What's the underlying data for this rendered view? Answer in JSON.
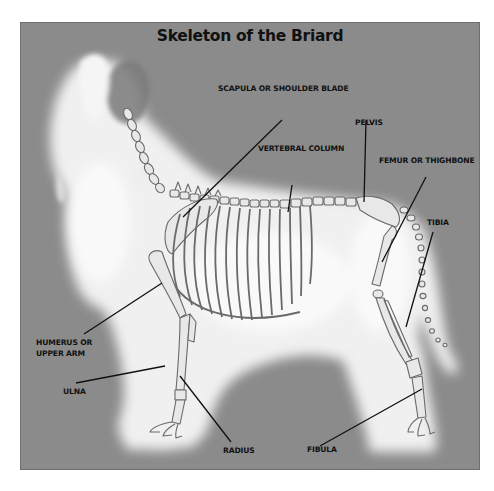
{
  "title": "Skeleton of the Briard",
  "colors": {
    "panel": "#8b8b8b",
    "fur": "#f2f2f2",
    "bone_outline": "#6a6a6a",
    "bone_fill": "#e6e6e6",
    "leader_line": "#111111",
    "label_text": "#111111"
  },
  "labels": {
    "scapula": "SCAPULA OR SHOULDER BLADE",
    "vertebral_column": "VERTEBRAL COLUMN",
    "pelvis": "PELVIS",
    "femur": "FEMUR OR THIGHBONE",
    "tibia": "TIBIA",
    "humerus_line1": "HUMERUS OR",
    "humerus_line2": "UPPER ARM",
    "ulna": "ULNA",
    "radius": "RADIUS",
    "fibula": "FIBULA"
  }
}
